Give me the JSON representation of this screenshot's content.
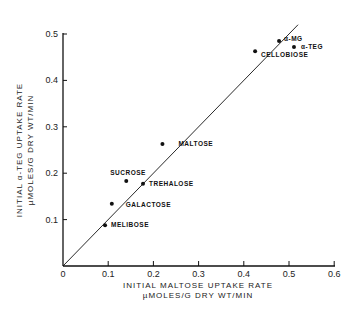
{
  "chart_data": {
    "type": "scatter",
    "title": "",
    "xlabel": "INITIAL MALTOSE UPTAKE RATE",
    "xlabel_units": "µMOLES/G DRY WT/MIN",
    "ylabel": "INITIAL α-TEG UPTAKE RATE",
    "ylabel_units": "µMOLES/G DRY WT/MIN",
    "xlim": [
      0,
      0.6
    ],
    "ylim": [
      0,
      0.5
    ],
    "xticks": [
      "0",
      "0.1",
      "0.2",
      "0.3",
      "0.4",
      "0.5",
      "0.6"
    ],
    "yticks": [
      "0.1",
      "0.2",
      "0.3",
      "0.4",
      "0.5"
    ],
    "grid": false,
    "legend": null,
    "reference_line": {
      "label": "line of identity (y = x)",
      "from": [
        0,
        0
      ],
      "to": [
        0.52,
        0.52
      ]
    },
    "points": [
      {
        "label": "MELIBOSE",
        "x": 0.093,
        "y": 0.088
      },
      {
        "label": "GALACTOSE",
        "x": 0.108,
        "y": 0.134
      },
      {
        "label": "SUCROSE",
        "x": 0.14,
        "y": 0.183
      },
      {
        "label": "TREHALOSE",
        "x": 0.177,
        "y": 0.177
      },
      {
        "label": "MALTOSE",
        "x": 0.22,
        "y": 0.263
      },
      {
        "label": "CELLOBIOSE",
        "x": 0.425,
        "y": 0.463
      },
      {
        "label": "α-MG",
        "x": 0.478,
        "y": 0.485
      },
      {
        "label": "α-TEG",
        "x": 0.511,
        "y": 0.472
      }
    ]
  },
  "colors": {
    "ink": "#111111",
    "background": "#ffffff"
  }
}
